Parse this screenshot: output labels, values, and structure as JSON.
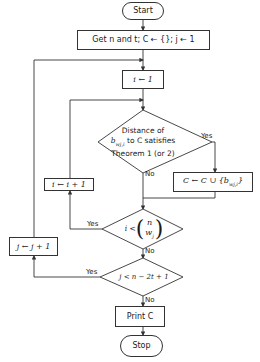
{
  "nodes": {
    "start": "Start",
    "init": "Get n and t; C ← {}; j ← 1",
    "set_i": "i ← 1",
    "decision_distance": {
      "line1": "Distance of",
      "line2": "b_{w_j,i} to C satisfies",
      "line3": "Theorem 1 (or 2)",
      "var": "b",
      "sub": "wj,i",
      "to_c": " to C satisfies"
    },
    "add_c": {
      "prefix": "C ← C ∪ {",
      "var": "b",
      "sub": "wj,i",
      "suffix": "}"
    },
    "inc_i": "i ← i + 1",
    "decision_i": {
      "lhs": "i <",
      "top": "n",
      "bottom": "w",
      "bottom_sub": "j"
    },
    "inc_j": "j ← j + 1",
    "decision_j": "j < n − 2t + 1",
    "print": "Print C",
    "stop": "Stop"
  },
  "labels": {
    "yes": "Yes",
    "no": "No"
  },
  "colors": {
    "line": "#333333",
    "background": "#ffffff"
  }
}
